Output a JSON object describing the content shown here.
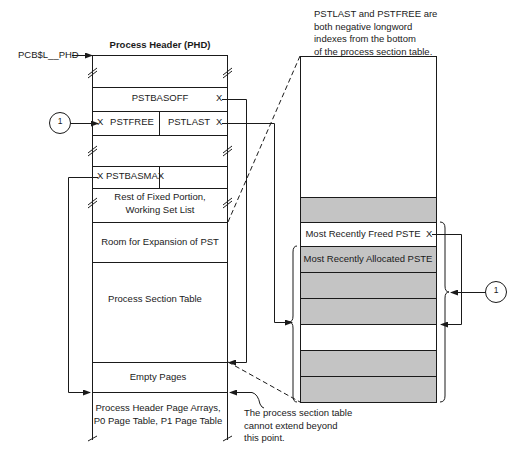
{
  "diagram": {
    "pointer_label": "PCB$L__PHD",
    "header_title": "Process Header (PHD)",
    "left_column": {
      "rows": [
        {
          "id": "top-blank",
          "label": ""
        },
        {
          "id": "pstbasoff",
          "label": "PSTBASOFF"
        },
        {
          "id": "pstfree",
          "label": "PSTFREE"
        },
        {
          "id": "pstlast",
          "label": "PSTLAST"
        },
        {
          "id": "gap-blank",
          "label": ""
        },
        {
          "id": "pstbasmax",
          "label": "PSTBASMAX"
        },
        {
          "id": "rest-fixed",
          "line1": "Rest of Fixed Portion,",
          "line2": "Working Set List"
        },
        {
          "id": "room-expansion",
          "label": "Room for Expansion of PST"
        },
        {
          "id": "process-section-table",
          "label": "Process Section Table"
        },
        {
          "id": "empty-pages",
          "label": "Empty Pages"
        },
        {
          "id": "page-arrays",
          "line1": "Process Header Page Arrays,",
          "line2": "P0 Page Table, P1 Page Table"
        }
      ]
    },
    "right_column": {
      "rows": [
        {
          "id": "free-space",
          "label": "",
          "shaded": false
        },
        {
          "id": "pste-1",
          "label": "",
          "shaded": true
        },
        {
          "id": "most-recently-freed",
          "label": "Most Recently Freed PSTE",
          "shaded": false
        },
        {
          "id": "most-recently-allocated",
          "label": "Most Recently Allocated PSTE",
          "shaded": true
        },
        {
          "id": "pste-4",
          "label": "",
          "shaded": true
        },
        {
          "id": "pste-5",
          "label": "",
          "shaded": true
        },
        {
          "id": "pste-6",
          "label": "",
          "shaded": false
        },
        {
          "id": "pste-7",
          "label": "",
          "shaded": true
        },
        {
          "id": "pste-8",
          "label": "",
          "shaded": true
        }
      ]
    },
    "callouts": {
      "circle_left": "1",
      "circle_right": "1",
      "x_mark": "X"
    },
    "notes": {
      "top_right": [
        "PSTLAST and PSTFREE are",
        "both negative longword",
        "indexes from the bottom",
        "of the process section table."
      ],
      "bottom": [
        "The process section table",
        "cannot extend beyond",
        "this point."
      ]
    },
    "colors": {
      "line": "#1a1a1a",
      "shade": "#c4c4c4",
      "background": "#ffffff"
    }
  }
}
